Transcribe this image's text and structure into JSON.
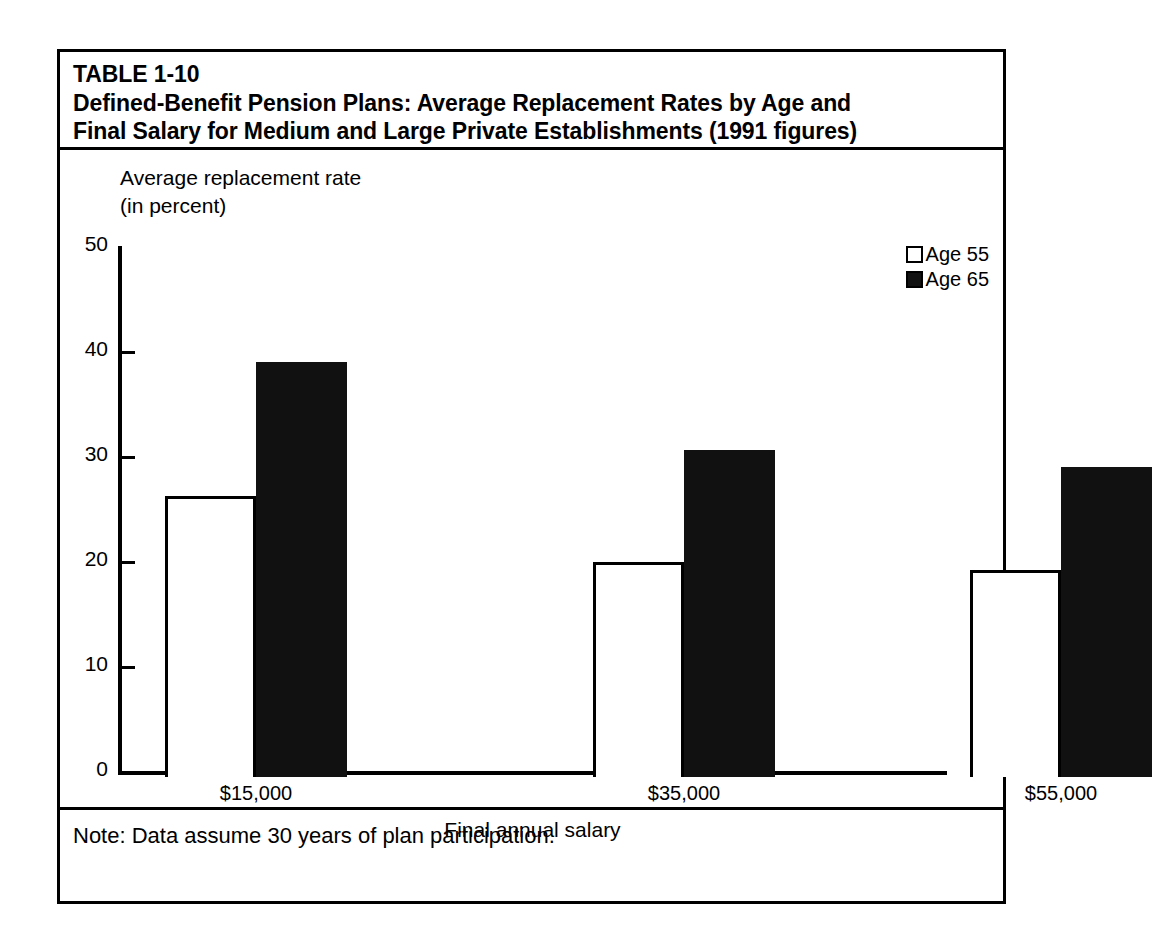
{
  "figure": {
    "table_number": "TABLE 1-10",
    "title_line_1": "Defined-Benefit Pension Plans:  Average Replacement Rates by Age and",
    "title_line_2": "Final Salary for Medium and Large Private Establishments (1991 figures)",
    "note": "Note:   Data assume 30 years of plan participation.",
    "colors": {
      "ink": "#000000",
      "paper": "#ffffff",
      "series_age_55": "#ffffff",
      "series_age_65": "#111111"
    }
  },
  "chart_data": {
    "type": "bar",
    "title": "Defined-Benefit Pension Plans:  Average Replacement Rates by Age and Final Salary for Medium and Large Private Establishments (1991 figures)",
    "categories": [
      "$15,000",
      "$35,000",
      "$55,000"
    ],
    "series": [
      {
        "name": "Age 55",
        "values": [
          26.8,
          20.5,
          19.7
        ],
        "fill": "open"
      },
      {
        "name": "Age 65",
        "values": [
          39.5,
          31.1,
          29.5
        ],
        "fill": "solid"
      }
    ],
    "xlabel": "Final annual salary",
    "ylabel_line_1": "Average replacement rate",
    "ylabel_line_2": "(in percent)",
    "ylim": [
      0,
      50
    ],
    "yticks": [
      50,
      40,
      30,
      20,
      10,
      0
    ],
    "ytick_labels": [
      "50",
      "40",
      "30",
      "20",
      "10",
      "0"
    ],
    "grid": false,
    "legend_position": "top-right",
    "legend": [
      "Age 55",
      "Age 65"
    ]
  }
}
